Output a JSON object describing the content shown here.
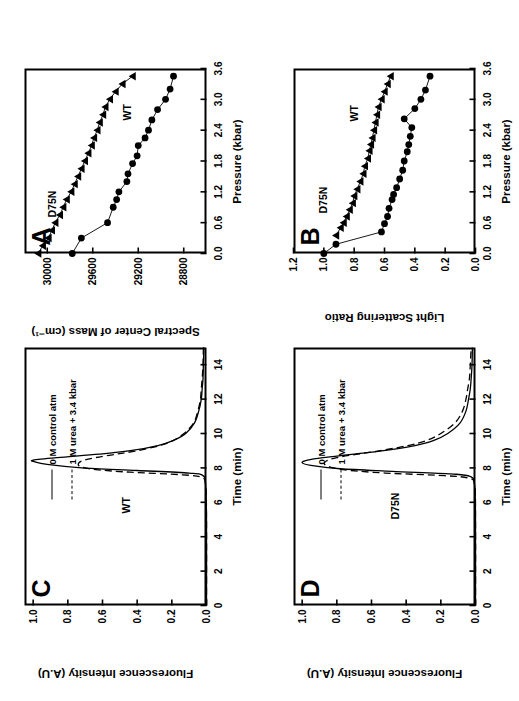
{
  "figure": {
    "background_color": "#ffffff",
    "line_color": "#000000",
    "rotation_note": "90-deg-ccw"
  },
  "panels": {
    "A": {
      "letter": "A",
      "xlabel": "Pressure (kbar)",
      "ylabel": "Spectral Center of Mass (cm⁻¹)",
      "xticks": [
        "0.0",
        "0.6",
        "1.2",
        "1.8",
        "2.4",
        "3.0",
        "3.6"
      ],
      "yticks": [
        "28800",
        "29200",
        "29600",
        "30000"
      ],
      "label_d75n": "D75N",
      "label_wt": "WT"
    },
    "B": {
      "letter": "B",
      "xlabel": "Pressure (kbar)",
      "ylabel": "Light Scattering Ratio",
      "xticks": [
        "0.0",
        "0.6",
        "1.2",
        "1.8",
        "2.4",
        "3.0",
        "3.6"
      ],
      "yticks": [
        "0.0",
        "0.2",
        "0.4",
        "0.6",
        "0.8",
        "1.0",
        "1.2"
      ],
      "label_d75n": "D75N",
      "label_wt": "WT"
    },
    "C": {
      "letter": "C",
      "xlabel": "Time (min)",
      "ylabel": "Fluorescence Intensity (A.U)",
      "xticks": [
        "0",
        "2",
        "4",
        "6",
        "8",
        "10",
        "12",
        "14"
      ],
      "yticks": [
        "0.0",
        "0.2",
        "0.4",
        "0.6",
        "0.8",
        "1.0"
      ],
      "sample_label": "WT",
      "legend": [
        {
          "label": "0 M control atm",
          "style": "solid"
        },
        {
          "label": "1 M urea + 3.4 kbar",
          "style": "dashed"
        }
      ]
    },
    "D": {
      "letter": "D",
      "xlabel": "Time (min)",
      "ylabel": "Fluorescence Intensity (A.U)",
      "xticks": [
        "0",
        "2",
        "4",
        "6",
        "8",
        "10",
        "12",
        "14"
      ],
      "yticks": [
        "0.0",
        "0.2",
        "0.4",
        "0.6",
        "0.8",
        "1.0"
      ],
      "sample_label": "D75N",
      "legend": [
        {
          "label": "0 M control atm",
          "style": "solid"
        },
        {
          "label": "1 M urea + 3.4 kbar",
          "style": "dashed"
        }
      ]
    }
  },
  "chart_data": [
    {
      "panel": "A",
      "type": "scatter",
      "title": "A",
      "xlabel": "Pressure (kbar)",
      "ylabel": "Spectral Center of Mass (cm-1)",
      "xlim": [
        0.0,
        3.6
      ],
      "ylim": [
        28600,
        30200
      ],
      "grid": false,
      "legend_position": "in-plot-annotation",
      "series": [
        {
          "name": "D75N",
          "marker": "triangle",
          "x": [
            0.0,
            0.15,
            0.3,
            0.45,
            0.6,
            0.75,
            0.9,
            1.05,
            1.2,
            1.35,
            1.5,
            1.65,
            1.8,
            1.95,
            2.1,
            2.25,
            2.4,
            2.55,
            2.7,
            2.85,
            3.0,
            3.15,
            3.3,
            3.45
          ],
          "y": [
            30080,
            30040,
            29990,
            29960,
            29930,
            29890,
            29860,
            29830,
            29790,
            29760,
            29730,
            29700,
            29670,
            29640,
            29610,
            29590,
            29560,
            29540,
            29510,
            29490,
            29450,
            29400,
            29340,
            29250
          ]
        },
        {
          "name": "WT",
          "marker": "circle",
          "x": [
            0.0,
            0.3,
            0.6,
            0.9,
            1.05,
            1.2,
            1.4,
            1.55,
            1.75,
            1.9,
            2.1,
            2.25,
            2.4,
            2.6,
            2.8,
            3.0,
            3.2,
            3.45
          ],
          "y": [
            29780,
            29700,
            29470,
            29420,
            29390,
            29370,
            29300,
            29290,
            29250,
            29210,
            29200,
            29140,
            29110,
            29080,
            29030,
            28960,
            28920,
            28890
          ]
        }
      ]
    },
    {
      "panel": "B",
      "type": "scatter",
      "title": "B",
      "xlabel": "Pressure (kbar)",
      "ylabel": "Light Scattering Ratio",
      "xlim": [
        0.0,
        3.6
      ],
      "ylim": [
        0.0,
        1.2
      ],
      "grid": false,
      "legend_position": "in-plot-annotation",
      "series": [
        {
          "name": "D75N",
          "marker": "triangle",
          "x": [
            0.35,
            0.5,
            0.6,
            0.72,
            0.85,
            0.98,
            1.12,
            1.25,
            1.4,
            1.55,
            1.7,
            1.85,
            2.0,
            2.12,
            2.25,
            2.4,
            2.55,
            2.7,
            2.85,
            3.0,
            3.15,
            3.3,
            3.45
          ],
          "y": [
            0.92,
            0.89,
            0.87,
            0.85,
            0.83,
            0.81,
            0.8,
            0.78,
            0.76,
            0.74,
            0.73,
            0.71,
            0.7,
            0.69,
            0.68,
            0.67,
            0.66,
            0.65,
            0.64,
            0.62,
            0.6,
            0.58,
            0.56
          ]
        },
        {
          "name": "WT",
          "marker": "circle",
          "x": [
            0.0,
            0.18,
            0.42,
            0.58,
            0.72,
            0.88,
            1.05,
            1.15,
            1.28,
            1.45,
            1.62,
            1.8,
            1.98,
            2.12,
            2.28,
            2.45,
            2.62,
            2.82,
            3.0,
            3.18,
            3.45
          ],
          "y": [
            1.0,
            0.92,
            0.62,
            0.6,
            0.58,
            0.57,
            0.55,
            0.54,
            0.52,
            0.5,
            0.48,
            0.47,
            0.45,
            0.44,
            0.43,
            0.42,
            0.47,
            0.4,
            0.36,
            0.33,
            0.3
          ]
        }
      ]
    },
    {
      "panel": "C",
      "type": "line",
      "title": "C",
      "xlabel": "Time (min)",
      "ylabel": "Fluorescence Intensity (A.U)",
      "xlim": [
        0,
        15
      ],
      "ylim": [
        0.0,
        1.05
      ],
      "grid": false,
      "annotation": "WT",
      "legend_position": "upper-left",
      "series": [
        {
          "name": "0 M control atm",
          "style": "solid",
          "x": [
            0,
            5.0,
            7.0,
            7.55,
            7.7,
            7.85,
            8.0,
            8.2,
            8.35,
            8.45,
            8.6,
            8.8,
            9.0,
            9.3,
            9.6,
            10.0,
            10.6,
            11.3,
            12.0,
            12.6,
            13.2,
            14.0,
            15.0
          ],
          "y": [
            0.0,
            0.0,
            0.005,
            0.02,
            0.1,
            0.4,
            0.72,
            0.92,
            0.99,
            1.0,
            0.86,
            0.62,
            0.44,
            0.28,
            0.19,
            0.12,
            0.07,
            0.045,
            0.03,
            0.025,
            0.02,
            0.018,
            0.015
          ]
        },
        {
          "name": "1 M urea + 3.4 kbar",
          "style": "dashed",
          "x": [
            0,
            5.0,
            7.0,
            7.45,
            7.6,
            7.75,
            7.9,
            8.05,
            8.2,
            8.4,
            8.6,
            8.8,
            9.0,
            9.3,
            9.6,
            10.0,
            10.6,
            11.3,
            12.0,
            12.6,
            13.2,
            14.0,
            15.0
          ],
          "y": [
            0.0,
            0.0,
            0.005,
            0.03,
            0.14,
            0.44,
            0.64,
            0.72,
            0.74,
            0.72,
            0.64,
            0.52,
            0.4,
            0.27,
            0.19,
            0.13,
            0.075,
            0.05,
            0.035,
            0.03,
            0.025,
            0.02,
            0.018
          ]
        }
      ]
    },
    {
      "panel": "D",
      "type": "line",
      "title": "D",
      "xlabel": "Time (min)",
      "ylabel": "Fluorescence Intensity (A.U)",
      "xlim": [
        0,
        15
      ],
      "ylim": [
        0.0,
        1.05
      ],
      "grid": false,
      "annotation": "D75N",
      "legend_position": "upper-left",
      "series": [
        {
          "name": "0 M control atm",
          "style": "solid",
          "x": [
            0,
            5.0,
            7.0,
            7.5,
            7.65,
            7.8,
            7.95,
            8.15,
            8.3,
            8.45,
            8.6,
            8.8,
            9.0,
            9.3,
            9.6,
            10.0,
            10.6,
            11.3,
            12.0,
            12.6,
            13.2,
            14.0,
            15.0
          ],
          "y": [
            0.0,
            0.0,
            0.005,
            0.03,
            0.14,
            0.48,
            0.78,
            0.95,
            1.0,
            0.97,
            0.88,
            0.7,
            0.53,
            0.35,
            0.24,
            0.16,
            0.09,
            0.055,
            0.04,
            0.03,
            0.025,
            0.02,
            0.018
          ]
        },
        {
          "name": "1 M urea + 3.4 kbar",
          "style": "dashed",
          "x": [
            0,
            5.0,
            7.0,
            7.4,
            7.55,
            7.7,
            7.85,
            8.0,
            8.2,
            8.4,
            8.6,
            8.8,
            9.0,
            9.3,
            9.6,
            10.0,
            10.6,
            11.3,
            12.0,
            12.6,
            13.2,
            14.0,
            15.0
          ],
          "y": [
            0.0,
            0.0,
            0.005,
            0.04,
            0.18,
            0.52,
            0.72,
            0.82,
            0.87,
            0.86,
            0.8,
            0.68,
            0.55,
            0.39,
            0.28,
            0.2,
            0.12,
            0.075,
            0.055,
            0.045,
            0.035,
            0.03,
            0.025
          ]
        }
      ]
    }
  ]
}
